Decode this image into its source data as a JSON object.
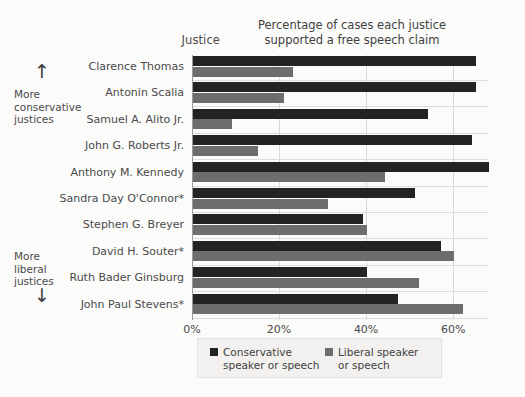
{
  "headers": {
    "justice_column": "Justice",
    "title_line1": "Percentage of cases each justice",
    "title_line2": "supported a free speech claim"
  },
  "annotations": {
    "conservative": {
      "line1": "More",
      "line2": "conservative",
      "line3": "justices",
      "arrow": "↑"
    },
    "liberal": {
      "line1": "More",
      "line2": "liberal",
      "line3": "justices",
      "arrow": "↓"
    }
  },
  "colors": {
    "conservative": "#232323",
    "liberal": "#6d6d6d",
    "background": "#fbfbfa",
    "gridline": "#d8d8d8"
  },
  "legend": {
    "items": [
      {
        "label_line1": "Conservative",
        "label_line2": "speaker or speech",
        "color": "#232323"
      },
      {
        "label_line1": "Liberal speaker",
        "label_line2": "or speech",
        "color": "#6d6d6d"
      }
    ]
  },
  "chart_data": {
    "type": "bar",
    "orientation": "horizontal",
    "title": "Percentage of cases each justice supported a free speech claim",
    "xlabel": "",
    "ylabel": "Justice",
    "xlim": [
      0,
      68
    ],
    "xticks": [
      0,
      20,
      40,
      60
    ],
    "xtick_labels": [
      "0%",
      "20%",
      "40%",
      "60%"
    ],
    "grid": "vertical",
    "legend_position": "bottom",
    "categories": [
      "Clarence Thomas",
      "Antonin Scalia",
      "Samuel A. Alito Jr.",
      "John G. Roberts Jr.",
      "Anthony M. Kennedy",
      "Sandra Day O'Connor*",
      "Stephen G. Breyer",
      "David H. Souter*",
      "Ruth Bader Ginsburg",
      "John Paul Stevens*"
    ],
    "series": [
      {
        "name": "Conservative speaker or speech",
        "color": "#232323",
        "values": [
          65,
          65,
          54,
          64,
          68,
          51,
          39,
          57,
          40,
          47
        ]
      },
      {
        "name": "Liberal speaker or speech",
        "color": "#6d6d6d",
        "values": [
          23,
          21,
          9,
          15,
          44,
          31,
          40,
          60,
          52,
          62
        ]
      }
    ]
  }
}
